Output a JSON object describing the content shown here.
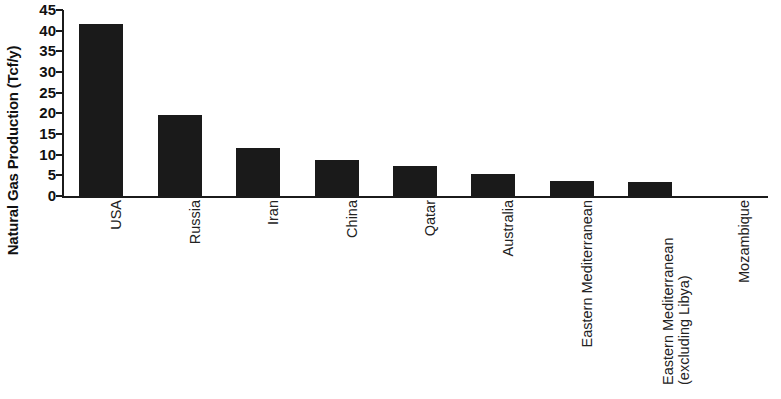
{
  "chart_data": {
    "type": "bar",
    "title": "",
    "subtitle": "",
    "xlabel": "",
    "ylabel": "Natural Gas Production (Tcf/y)",
    "categories": [
      "USA",
      "Russia",
      "Iran",
      "China",
      "Qatar",
      "Australia",
      "Eastern Mediterranean",
      "Eastern Mediterranean (excluding Libya)",
      "Mozambique"
    ],
    "values": [
      41.5,
      19.5,
      11.7,
      8.7,
      7.3,
      5.4,
      3.7,
      3.5,
      0
    ],
    "ylim": [
      0,
      45
    ],
    "ytick_labels": [
      "45",
      "40",
      "35",
      "30",
      "25",
      "20",
      "15",
      "10",
      "5",
      "0"
    ],
    "ytick_values": [
      45,
      40,
      35,
      30,
      25,
      20,
      15,
      10,
      5,
      0
    ],
    "ytick_step": 5,
    "grid": false,
    "legend": null,
    "bar_color": "#1a1a1a",
    "axis_color": "#1b1b1b",
    "background_color": "#ffffff",
    "category_label_rotation": -90,
    "category_label_lines": [
      [
        "USA"
      ],
      [
        "Russia"
      ],
      [
        "Iran"
      ],
      [
        "China"
      ],
      [
        "Qatar"
      ],
      [
        "Australia"
      ],
      [
        "Eastern Mediterranean"
      ],
      [
        "Eastern Mediterranean",
        "(excluding Libya)"
      ],
      [
        "Mozambique"
      ]
    ]
  }
}
